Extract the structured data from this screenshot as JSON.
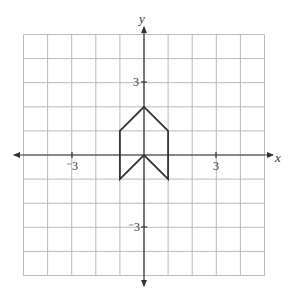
{
  "figure": {
    "x_axis_label": "x",
    "y_axis_label": "y",
    "tick_labels": {
      "x_neg": "⁻3",
      "x_pos": "3",
      "y_pos": "3",
      "y_neg": "⁻3"
    },
    "grid": {
      "xmin": -5,
      "xmax": 5,
      "ymin": -5,
      "ymax": 5,
      "step": 1
    },
    "shape": {
      "name": "arrow-hexagon",
      "vertices": [
        [
          0,
          2
        ],
        [
          1,
          1
        ],
        [
          1,
          -1
        ],
        [
          0,
          0
        ],
        [
          -1,
          -1
        ],
        [
          -1,
          1
        ]
      ]
    },
    "colors": {
      "grid": "#b9b9b9",
      "axis": "#333333",
      "shape": "#333333"
    }
  }
}
